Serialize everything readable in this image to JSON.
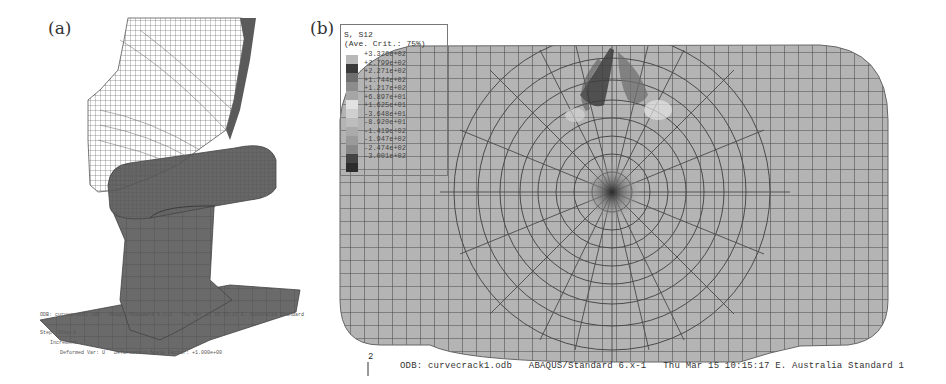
{
  "figure": {
    "panels": [
      {
        "label": "(a)",
        "description": "3D finite element mesh of wheel in contact with rail",
        "footer_lines": [
          "ODB: curvecrack1.odb   Abaqus/Standard 6.x-1   Thu Mar 15 10:15:17 E. Australia Standard",
          "Step: Step-1",
          "Increment",
          "Deformed Var: U   Deformation Scale Factor: +1.000e+00"
        ]
      },
      {
        "label": "(b)",
        "description": "2D mesh contour plot of shear stress S12 in rail cross-section",
        "legend": {
          "title_line1": "S, S12",
          "title_line2": "(Ave. Crit.: 75%)",
          "top_value": "+3.326e+02",
          "values": [
            "+3.326e+02",
            "+2.799e+02",
            "+2.271e+02",
            "+1.744e+02",
            "+1.217e+02",
            "+6.897e+01",
            "+1.625e+01",
            "-3.648e+01",
            "-8.920e+01",
            "-1.419e+02",
            "-1.947e+02",
            "-2.474e+02",
            "-3.001e+02"
          ],
          "colors": [
            "#b9b9b9",
            "#3a3a3a",
            "#6e6e6e",
            "#8c8c8c",
            "#a6a6a6",
            "#e2e2e2",
            "#cfcfcf",
            "#bdbdbd",
            "#aaaaaa",
            "#9a9a9a",
            "#888888",
            "#444444",
            "#2c2c2c"
          ]
        },
        "axis_tick": "2",
        "footer": "ODB: curvecrack1.odb   ABAQUS/Standard 6.x-1   Thu Mar 15 10:15:17 E. Australia Standard 1"
      }
    ]
  }
}
